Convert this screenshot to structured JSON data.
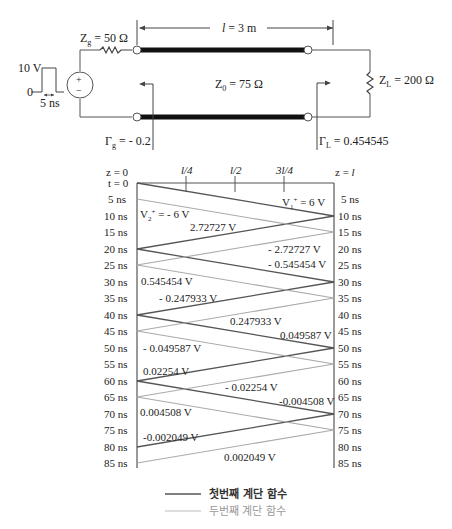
{
  "circuit": {
    "source_pulse": {
      "amplitude": "10 V",
      "baseline": "0",
      "width": "5 ns"
    },
    "source_polarity": {
      "plus": "+",
      "minus": "−"
    },
    "Zg": {
      "sym": "Z",
      "sub": "g",
      "val": "= 50 Ω"
    },
    "length": {
      "sym": "l",
      "val": "= 3 m"
    },
    "Z0": {
      "sym": "Z",
      "sub": "0",
      "val": "= 75 Ω"
    },
    "ZL": {
      "sym": "Z",
      "sub": "L",
      "val": "= 200 Ω"
    },
    "Gamma_g": {
      "sym": "Γ",
      "sub": "g",
      "val": "= - 0.2"
    },
    "Gamma_L": {
      "sym": "Γ",
      "sub": "L",
      "val": "= 0.454545"
    }
  },
  "bounce": {
    "z_left": "z = 0",
    "z_right_prefix": "z = ",
    "z_right_sym": "l",
    "top_ticks": [
      "l/4",
      "l/2",
      "3l/4"
    ],
    "left_times": [
      "t = 0",
      "5 ns",
      "10 ns",
      "15 ns",
      "20 ns",
      "25 ns",
      "30 ns",
      "35 ns",
      "40 ns",
      "45 ns",
      "50 ns",
      "55 ns",
      "60 ns",
      "65 ns",
      "70 ns",
      "75 ns",
      "80 ns",
      "85 ns"
    ],
    "right_times": [
      "5 ns",
      "10 ns",
      "15 ns",
      "20 ns",
      "25 ns",
      "30 ns",
      "35 ns",
      "40 ns",
      "45 ns",
      "50 ns",
      "55 ns",
      "60 ns",
      "65 ns",
      "70 ns",
      "75 ns",
      "80 ns",
      "85 ns"
    ],
    "V1": {
      "sym": "V",
      "sub": "1",
      "sup": "+",
      "val": "= 6 V"
    },
    "V2": {
      "sym": "V",
      "sub": "2",
      "sup": "+",
      "val": "= - 6 V"
    },
    "labels": [
      "2.72727 V",
      "- 2.72727 V",
      "- 0.545454 V",
      "0.545454 V",
      "- 0.247933 V",
      "0.247933 V",
      "0.049587 V",
      "- 0.049587 V",
      "0.02254 V",
      "- 0.02254 V",
      "-0.004508 V",
      "0.004508 V",
      "-0.002049 V",
      "0.002049 V"
    ],
    "colors": {
      "first": "#555555",
      "second": "#aaaaaa"
    }
  },
  "legend": {
    "first": "첫번째 계단 함수",
    "second": "두번째 계단 함수"
  }
}
